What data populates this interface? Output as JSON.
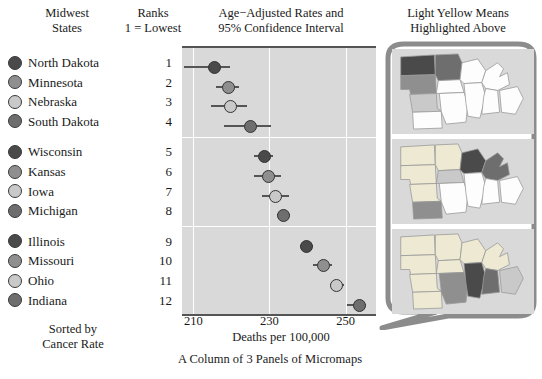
{
  "headers": {
    "states": "Midwest\nStates",
    "states_l1": "Midwest",
    "states_l2": "States",
    "ranks_l1": "Ranks",
    "ranks_l2": "1 = Lowest",
    "rates_l1": "Age−Adjusted Rates and",
    "rates_l2": "95% Confidence Interval",
    "maps_l1": "Light Yellow Means",
    "maps_l2": "Highlighted Above"
  },
  "sorted_note_l1": "Sorted by",
  "sorted_note_l2": "Cancer Rate",
  "axis_title": "Deaths per 100,000",
  "caption": "A Column of 3 Panels of Micromaps",
  "axis_ticks": [
    "210",
    "230",
    "250"
  ],
  "colors": {
    "dot_dark": "#4a4a4a",
    "dot_medium": "#8f8f8f",
    "dot_light": "#c9c9c9",
    "dot_middark": "#6e6e6e",
    "plot_background": "#d9d9d9",
    "gridline": "#ffffff",
    "highlight_yellow": "#ede9d2",
    "bubble_border": "#8c8c8c"
  },
  "chart_data": {
    "type": "scatter",
    "title": "Age−Adjusted Rates and 95% Confidence Interval",
    "xlabel": "Deaths per 100,000",
    "ylabel": "Midwest States",
    "xlim": [
      207,
      258
    ],
    "ticks": [
      210,
      230,
      250
    ],
    "grid": true,
    "legend": "none",
    "panels": [
      {
        "panel": 1,
        "rows": [
          {
            "state": "North Dakota",
            "rank": 1,
            "value": 215.5,
            "ci_low": 207.5,
            "ci_high": 219.5,
            "shade": "#4a4a4a"
          },
          {
            "state": "Minnesota",
            "rank": 2,
            "value": 219.0,
            "ci_low": 216.0,
            "ci_high": 222.0,
            "shade": "#8f8f8f"
          },
          {
            "state": "Nebraska",
            "rank": 3,
            "value": 219.5,
            "ci_low": 214.5,
            "ci_high": 224.0,
            "shade": "#c9c9c9"
          },
          {
            "state": "South Dakota",
            "rank": 4,
            "value": 225.0,
            "ci_low": 218.0,
            "ci_high": 230.5,
            "shade": "#6e6e6e"
          }
        ]
      },
      {
        "panel": 2,
        "rows": [
          {
            "state": "Wisconsin",
            "rank": 5,
            "value": 228.5,
            "ci_low": 226.0,
            "ci_high": 231.0,
            "shade": "#4a4a4a"
          },
          {
            "state": "Kansas",
            "rank": 6,
            "value": 229.5,
            "ci_low": 226.0,
            "ci_high": 233.0,
            "shade": "#8f8f8f"
          },
          {
            "state": "Iowa",
            "rank": 7,
            "value": 231.5,
            "ci_low": 228.0,
            "ci_high": 235.0,
            "shade": "#c9c9c9"
          },
          {
            "state": "Michigan",
            "rank": 8,
            "value": 233.5,
            "ci_low": 232.0,
            "ci_high": 235.5,
            "shade": "#6e6e6e"
          }
        ]
      },
      {
        "panel": 3,
        "rows": [
          {
            "state": "Illinois",
            "rank": 9,
            "value": 239.5,
            "ci_low": 238.0,
            "ci_high": 241.5,
            "shade": "#4a4a4a"
          },
          {
            "state": "Missouri",
            "rank": 10,
            "value": 244.0,
            "ci_low": 241.5,
            "ci_high": 246.5,
            "shade": "#8f8f8f"
          },
          {
            "state": "Ohio",
            "rank": 11,
            "value": 247.5,
            "ci_low": 246.0,
            "ci_high": 249.5,
            "shade": "#c9c9c9"
          },
          {
            "state": "Indiana",
            "rank": 12,
            "value": 253.5,
            "ci_low": 250.5,
            "ci_high": 255.5,
            "shade": "#6e6e6e"
          }
        ]
      }
    ]
  },
  "micromaps": [
    {
      "panel": 1,
      "highlighted": [
        "North Dakota",
        "Minnesota",
        "Nebraska",
        "South Dakota"
      ]
    },
    {
      "panel": 2,
      "highlighted": [
        "Wisconsin",
        "Kansas",
        "Iowa",
        "Michigan"
      ]
    },
    {
      "panel": 3,
      "highlighted": [
        "Illinois",
        "Missouri",
        "Ohio",
        "Indiana"
      ]
    }
  ]
}
